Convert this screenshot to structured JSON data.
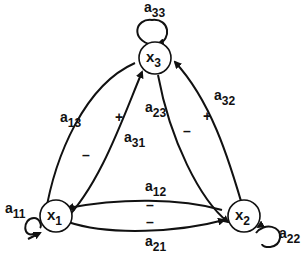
{
  "nodes": {
    "x1": {
      "main": "x",
      "sub": "1"
    },
    "x2": {
      "main": "x",
      "sub": "2"
    },
    "x3": {
      "main": "x",
      "sub": "3"
    }
  },
  "edges": {
    "a11": {
      "main": "a",
      "sub": "11"
    },
    "a22": {
      "main": "a",
      "sub": "22"
    },
    "a33": {
      "main": "a",
      "sub": "33"
    },
    "a13": {
      "main": "a",
      "sub": "13",
      "sign": "–"
    },
    "a31": {
      "main": "a",
      "sub": "31",
      "sign": "+"
    },
    "a23": {
      "main": "a",
      "sub": "23",
      "sign": "–"
    },
    "a32": {
      "main": "a",
      "sub": "32",
      "sign": "+"
    },
    "a12": {
      "main": "a",
      "sub": "12",
      "sign": "–"
    },
    "a21": {
      "main": "a",
      "sub": "21",
      "sign": "–"
    }
  },
  "colors": {
    "ink": "#111111",
    "background": "#ffffff"
  }
}
